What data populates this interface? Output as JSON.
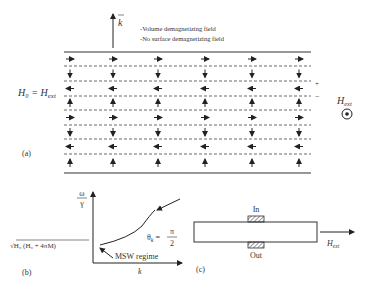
{
  "panel_a": {
    "label": "(a)",
    "k_label": "k",
    "notes": [
      "-Volume demagnetizing field",
      "-No surface demagnetizing field"
    ],
    "left_label": "H₀ = H",
    "left_label_sub": "ext",
    "plus": "+",
    "minus": "−",
    "hext": "H",
    "hext_sub": "ext",
    "rows": [
      "right",
      "down",
      "left",
      "up",
      "right",
      "down",
      "left",
      "up"
    ],
    "columns": 6
  },
  "panel_b": {
    "label": "(b)",
    "y_label_num": "ω",
    "y_label_den": "γ",
    "x_label": "k",
    "intercept_label": "√H₀ (H₀ + 4πM)",
    "theta_label": "θ",
    "theta_sub": "k",
    "theta_value_num": "π",
    "theta_value_den": "2",
    "regime_label": "MSW regime"
  },
  "panel_c": {
    "label": "(c)",
    "in_label": "In",
    "out_label": "Out",
    "hext": "H",
    "hext_sub": "ext"
  }
}
